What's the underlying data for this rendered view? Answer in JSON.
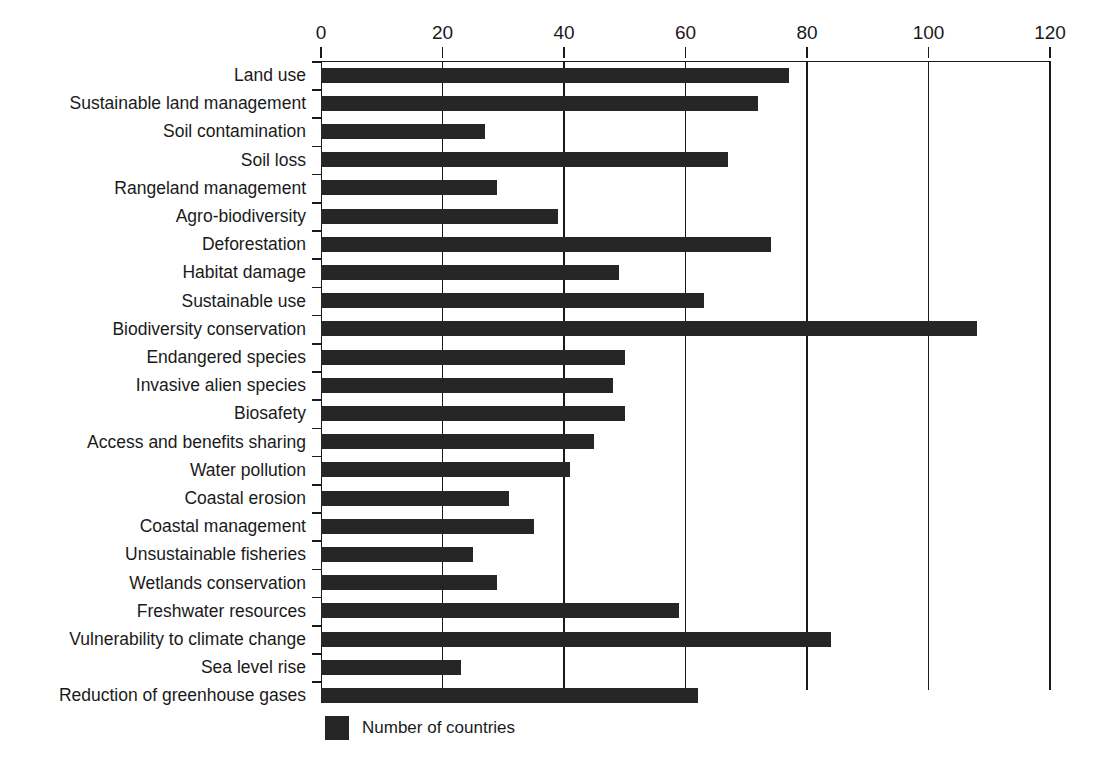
{
  "chart_data": {
    "type": "bar",
    "orientation": "horizontal",
    "title": "",
    "xlabel": "",
    "ylabel": "",
    "xlim": [
      0,
      120
    ],
    "xticks": [
      0,
      20,
      40,
      60,
      80,
      100,
      120
    ],
    "tick_labels": [
      "0",
      "20",
      "40",
      "60",
      "80",
      "100",
      "120"
    ],
    "grid": true,
    "grid_axis": "x",
    "legend": {
      "position": "bottom-left",
      "entries": [
        {
          "label": "Number of countries",
          "color": "#262626"
        }
      ]
    },
    "series_name": "Number of countries",
    "bar_color": "#262626",
    "categories": [
      "Land use",
      "Sustainable land management",
      "Soil contamination",
      "Soil loss",
      "Rangeland management",
      "Agro-biodiversity",
      "Deforestation",
      "Habitat damage",
      "Sustainable use",
      "Biodiversity conservation",
      "Endangered species",
      "Invasive alien species",
      "Biosafety",
      "Access and benefits sharing",
      "Water pollution",
      "Coastal erosion",
      "Coastal management",
      "Unsustainable fisheries",
      "Wetlands conservation",
      "Freshwater resources",
      "Vulnerability to climate change",
      "Sea level rise",
      "Reduction of greenhouse gases"
    ],
    "values": [
      77,
      72,
      27,
      67,
      29,
      39,
      74,
      49,
      63,
      108,
      50,
      48,
      50,
      45,
      41,
      31,
      35,
      25,
      29,
      59,
      84,
      23,
      62
    ]
  },
  "legend": {
    "label": "Number of countries"
  }
}
